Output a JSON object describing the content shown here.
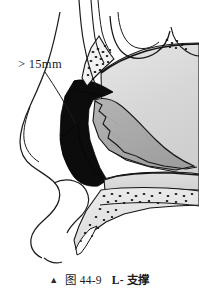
{
  "figure": {
    "title_caption": {
      "marker": "▲",
      "fig_word": "图",
      "number": "44-9",
      "label": "L- 支撑"
    },
    "annotations": [
      {
        "name": "strut-width-callout",
        "text": "> 15mm",
        "leader": true
      }
    ],
    "colors": {
      "background": "#ffffff",
      "outline": "#121212",
      "graft_black": "#0d0d0d",
      "cartilage_mid_gray": "#a9a9a9",
      "bone_light_gray": "#d9d9d9",
      "bone_pale_gray": "#e4e4e4",
      "stipple": "#1a1a1a"
    },
    "regions": [
      {
        "name": "skin-profile",
        "label": "facial soft tissue profile"
      },
      {
        "name": "nasal-bone",
        "label": "nasal bone with stippling"
      },
      {
        "name": "perpendicular-plate",
        "label": "perpendicular plate of ethmoid"
      },
      {
        "name": "septal-cartilage",
        "label": "quadrangular septal cartilage"
      },
      {
        "name": "l-strut-graft",
        "label": "L-strut graft"
      },
      {
        "name": "vomer",
        "label": "vomer"
      },
      {
        "name": "maxillary-crest",
        "label": "maxillary crest and nasal spine"
      }
    ]
  }
}
